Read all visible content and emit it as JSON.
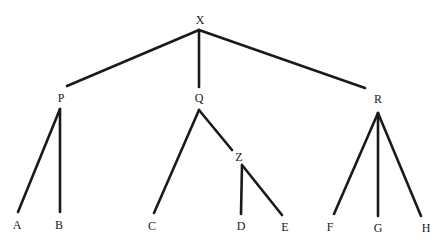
{
  "diagram": {
    "type": "tree",
    "nodes": [
      {
        "id": "X",
        "label": "X"
      },
      {
        "id": "P",
        "label": "P"
      },
      {
        "id": "Q",
        "label": "Q"
      },
      {
        "id": "R",
        "label": "R"
      },
      {
        "id": "Z",
        "label": "Z"
      },
      {
        "id": "A",
        "label": "A"
      },
      {
        "id": "B",
        "label": "B"
      },
      {
        "id": "C",
        "label": "C"
      },
      {
        "id": "D",
        "label": "D"
      },
      {
        "id": "E",
        "label": "E"
      },
      {
        "id": "F",
        "label": "F"
      },
      {
        "id": "G",
        "label": "G"
      },
      {
        "id": "H",
        "label": "H"
      }
    ],
    "edges": [
      {
        "from": "X",
        "to": "P"
      },
      {
        "from": "X",
        "to": "Q"
      },
      {
        "from": "X",
        "to": "R"
      },
      {
        "from": "P",
        "to": "A"
      },
      {
        "from": "P",
        "to": "B"
      },
      {
        "from": "Q",
        "to": "C"
      },
      {
        "from": "Q",
        "to": "Z"
      },
      {
        "from": "Z",
        "to": "D"
      },
      {
        "from": "Z",
        "to": "E"
      },
      {
        "from": "R",
        "to": "F"
      },
      {
        "from": "R",
        "to": "G"
      },
      {
        "from": "R",
        "to": "H"
      }
    ]
  }
}
